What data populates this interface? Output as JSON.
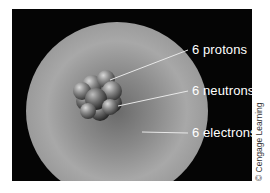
{
  "diagram": {
    "labels": [
      {
        "id": "protons",
        "text": "6 protons"
      },
      {
        "id": "neutrons",
        "text": "6 neutrons"
      },
      {
        "id": "electrons",
        "text": "6 electrons"
      }
    ],
    "credit": "© Cengage Learning",
    "colors": {
      "background": "#050505",
      "label_text": "#ffffff",
      "electron_cloud": "#a8a8a8",
      "nucleus": "#7a7a7a"
    }
  }
}
